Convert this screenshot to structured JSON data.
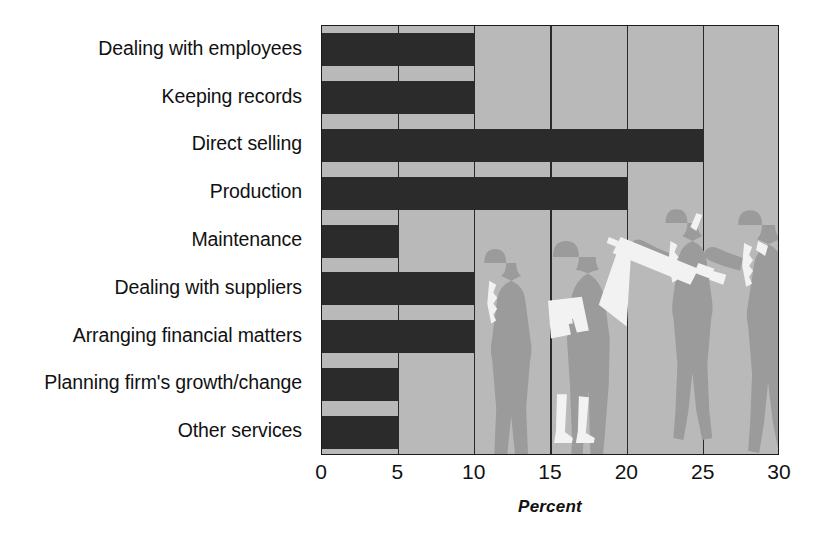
{
  "chart_data": {
    "type": "bar",
    "orientation": "horizontal",
    "title": "",
    "xlabel": "Percent",
    "ylabel": "",
    "xlim": [
      0,
      30
    ],
    "xticks": [
      0,
      5,
      10,
      15,
      20,
      25,
      30
    ],
    "xtick_labels": [
      "0",
      "5",
      "10",
      "15",
      "20",
      "25",
      "30"
    ],
    "grid": true,
    "grid_axis": "x",
    "legend": false,
    "categories": [
      "Dealing with employees",
      "Keeping records",
      "Direct selling",
      "Production",
      "Maintenance",
      "Dealing with suppliers",
      "Arranging financial matters",
      "Planning firm's growth/change",
      "Other services"
    ],
    "values": [
      10,
      10,
      25,
      20,
      5,
      10,
      10,
      5,
      5
    ],
    "colors": {
      "bar": "#2b2b2b",
      "plot_background": "#b9b9b9",
      "page_background": "#ffffff",
      "axis": "#1a1a1a",
      "gridline": "#2a2a2a",
      "text": "#111111",
      "silhouette": "#9b9b9b",
      "silhouette_highlight": "#f2f2f2"
    },
    "decoration": {
      "description": "Grayscale silhouettes of four business people behind the bars",
      "figures": [
        "businessman-standing",
        "businesswoman-holding-papers",
        "man-holding-blueprint",
        "man-reviewing-blueprint"
      ]
    }
  }
}
